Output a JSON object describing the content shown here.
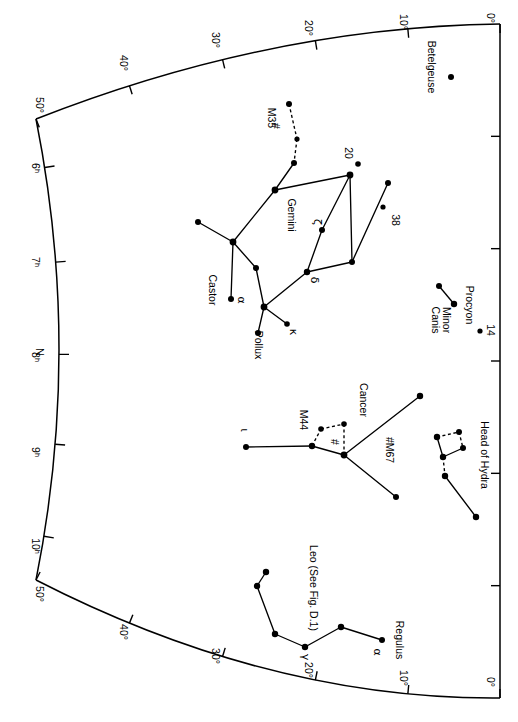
{
  "figure": {
    "kind": "star-chart",
    "orientation_note": "all text rotated 90 degrees clockwise"
  },
  "axes": {
    "declination_top_label": "Declination",
    "top_ticks": [
      {
        "label": "50°",
        "x": 36,
        "y": 105
      },
      {
        "label": "40°",
        "x": 120,
        "y": 63
      },
      {
        "label": "30°",
        "x": 212,
        "y": 40
      },
      {
        "label": "20°",
        "x": 305,
        "y": 28
      },
      {
        "label": "10°",
        "x": 400,
        "y": 22
      },
      {
        "label": "0°",
        "x": 487,
        "y": 18
      }
    ],
    "bottom_ticks": [
      {
        "label": "50°",
        "x": 36,
        "y": 594
      },
      {
        "label": "40°",
        "x": 120,
        "y": 632
      },
      {
        "label": "30°",
        "x": 212,
        "y": 656
      },
      {
        "label": "20°",
        "x": 305,
        "y": 670
      },
      {
        "label": "10°",
        "x": 400,
        "y": 678
      },
      {
        "label": "0°",
        "x": 487,
        "y": 682
      }
    ],
    "ra_ticks": [
      {
        "label": "6",
        "sup": "h",
        "y": 168
      },
      {
        "label": "7",
        "sup": "h",
        "y": 262
      },
      {
        "label": "8",
        "sup": "h",
        "y": 357
      },
      {
        "label": "9",
        "sup": "h",
        "y": 452
      },
      {
        "label": "10",
        "sup": "h",
        "y": 546
      }
    ],
    "north_marker": "N"
  },
  "chart_data": {
    "type": "scatter",
    "title": "",
    "xlabel": "Declination",
    "ylabel": "Right Ascension",
    "xlim": [
      0,
      50
    ],
    "ylim": [
      6,
      10
    ],
    "grid": false,
    "legend": "none",
    "constellations": [
      {
        "name": "Gemini",
        "label": {
          "text": "Gemini",
          "x": 288,
          "y": 215
        },
        "stars": [
          {
            "id": "g1",
            "x": 289,
            "y": 104,
            "label": "",
            "r": 3.0
          },
          {
            "id": "g2",
            "x": 297,
            "y": 139,
            "label": "",
            "r": 2.6
          },
          {
            "id": "g3",
            "x": 294,
            "y": 163,
            "label": "",
            "r": 3.0
          },
          {
            "id": "g4",
            "x": 275,
            "y": 190,
            "label": "",
            "r": 3.4
          },
          {
            "id": "g5",
            "x": 233,
            "y": 242,
            "label": "",
            "r": 3.4
          },
          {
            "id": "g6",
            "x": 198,
            "y": 222,
            "label": "",
            "r": 3.0
          },
          {
            "id": "g7",
            "x": 231,
            "y": 299,
            "label": "α",
            "lx": 238,
            "ly": 300,
            "r": 3.0
          },
          {
            "id": "g8",
            "x": 256,
            "y": 268,
            "label": "",
            "r": 3.0
          },
          {
            "id": "g9",
            "x": 264,
            "y": 307,
            "label": "",
            "r": 3.4
          },
          {
            "id": "g10",
            "x": 258,
            "y": 333,
            "label": "",
            "r": 3.0
          },
          {
            "id": "g11",
            "x": 287,
            "y": 324,
            "label": "κ",
            "lx": 290,
            "ly": 332,
            "r": 2.8
          },
          {
            "id": "g12",
            "x": 307,
            "y": 272,
            "label": "δ",
            "lx": 311,
            "ly": 280,
            "r": 3.2
          },
          {
            "id": "g13",
            "x": 322,
            "y": 230,
            "label": "ζ",
            "lx": 314,
            "ly": 222,
            "r": 3.0
          },
          {
            "id": "g14",
            "x": 350,
            "y": 175,
            "label": "",
            "r": 3.4
          },
          {
            "id": "g15",
            "x": 358,
            "y": 164,
            "label": "20",
            "lx": 345,
            "ly": 153,
            "r": 2.8
          },
          {
            "id": "g16",
            "x": 352,
            "y": 262,
            "label": "",
            "r": 3.0
          },
          {
            "id": "g17",
            "x": 388,
            "y": 183,
            "label": "",
            "r": 3.0
          },
          {
            "id": "g18",
            "x": 383,
            "y": 207,
            "label": "38",
            "lx": 392,
            "ly": 220,
            "r": 2.6
          }
        ],
        "labels_extra": [
          {
            "text": "Castor",
            "x": 209,
            "y": 290
          },
          {
            "text": "Pollux",
            "x": 255,
            "y": 345
          },
          {
            "text": "M35",
            "x": 268,
            "y": 118
          },
          {
            "text": "#",
            "x": 272,
            "y": 126
          }
        ],
        "lines": [
          [
            "g1",
            "g2"
          ],
          [
            "g2",
            "g3"
          ],
          [
            "g3",
            "g4"
          ],
          [
            "g4",
            "g5"
          ],
          [
            "g5",
            "g6"
          ],
          [
            "g5",
            "g7"
          ],
          [
            "g5",
            "g8"
          ],
          [
            "g8",
            "g9"
          ],
          [
            "g9",
            "g10"
          ],
          [
            "g9",
            "g11"
          ],
          [
            "g9",
            "g12"
          ],
          [
            "g12",
            "g13"
          ],
          [
            "g13",
            "g14"
          ],
          [
            "g4",
            "g14"
          ],
          [
            "g14",
            "g16"
          ],
          [
            "g12",
            "g16"
          ],
          [
            "g16",
            "g17"
          ]
        ],
        "dashed_lines": [
          [
            "g1",
            "g2"
          ],
          [
            "g2",
            "g3"
          ]
        ]
      },
      {
        "name": "Cancer",
        "label": {
          "text": "Cancer",
          "x": 360,
          "y": 400
        },
        "stars": [
          {
            "id": "c1",
            "x": 246,
            "y": 447,
            "label": "ι",
            "lx": 241,
            "ly": 430,
            "r": 3.0
          },
          {
            "id": "c2",
            "x": 312,
            "y": 446,
            "label": "M44",
            "lx": 300,
            "ly": 420,
            "r": 3.2
          },
          {
            "id": "c3",
            "x": 321,
            "y": 429,
            "label": "",
            "r": 2.8
          },
          {
            "id": "c4",
            "x": 344,
            "y": 424,
            "label": "",
            "r": 2.8
          },
          {
            "id": "c5",
            "x": 344,
            "y": 455,
            "label": "",
            "r": 3.4
          },
          {
            "id": "c6",
            "x": 420,
            "y": 396,
            "label": "",
            "r": 3.2
          },
          {
            "id": "c7",
            "x": 396,
            "y": 497,
            "label": "#M67",
            "lx": 386,
            "ly": 450,
            "r": 3.0
          }
        ],
        "labels_extra": [
          {
            "text": "#",
            "x": 331,
            "y": 442
          }
        ],
        "lines": [
          [
            "c1",
            "c2"
          ],
          [
            "c2",
            "c5"
          ],
          [
            "c5",
            "c6"
          ],
          [
            "c5",
            "c7"
          ]
        ],
        "dashed_lines": [
          [
            "c2",
            "c3"
          ],
          [
            "c3",
            "c4"
          ],
          [
            "c4",
            "c5"
          ]
        ]
      },
      {
        "name": "Leo",
        "label": {
          "text": "Leo (See Fig. D.1)",
          "x": 310,
          "y": 588
        },
        "stars": [
          {
            "id": "l1",
            "x": 266,
            "y": 572,
            "label": "",
            "r": 3.2
          },
          {
            "id": "l2",
            "x": 257,
            "y": 586,
            "label": "",
            "r": 3.2
          },
          {
            "id": "l3",
            "x": 275,
            "y": 634,
            "label": "",
            "r": 3.2
          },
          {
            "id": "l4",
            "x": 305,
            "y": 647,
            "label": "γ",
            "lx": 302,
            "ly": 657,
            "r": 3.2
          },
          {
            "id": "l5",
            "x": 341,
            "y": 627,
            "label": "",
            "r": 3.2
          },
          {
            "id": "l6",
            "x": 382,
            "y": 640,
            "label": "α",
            "lx": 374,
            "ly": 652,
            "r": 3.0
          }
        ],
        "labels_extra": [
          {
            "text": "Regulus",
            "x": 396,
            "y": 640
          }
        ],
        "lines": [
          [
            "l1",
            "l2"
          ],
          [
            "l2",
            "l3"
          ],
          [
            "l3",
            "l4"
          ],
          [
            "l4",
            "l5"
          ],
          [
            "l5",
            "l6"
          ]
        ],
        "dashed_lines": []
      },
      {
        "name": "Canis Minor",
        "label": {
          "text": "Canis\nMinor",
          "x": 432,
          "y": 320
        },
        "stars": [
          {
            "id": "m1",
            "x": 439,
            "y": 286,
            "label": "",
            "r": 3.0
          },
          {
            "id": "m2",
            "x": 454,
            "y": 304,
            "label": "",
            "r": 3.2
          },
          {
            "id": "m3",
            "x": 480,
            "y": 331,
            "label": "14",
            "lx": 487,
            "ly": 330,
            "r": 2.6
          }
        ],
        "labels_extra": [
          {
            "text": "Procyon",
            "x": 466,
            "y": 305
          }
        ],
        "lines": [
          [
            "m1",
            "m2"
          ]
        ],
        "dashed_lines": []
      },
      {
        "name": "Head of Hydra",
        "label": {
          "text": "Head of Hydra",
          "x": 481,
          "y": 455
        },
        "stars": [
          {
            "id": "h1",
            "x": 437,
            "y": 437,
            "label": "",
            "r": 3.2
          },
          {
            "id": "h2",
            "x": 459,
            "y": 432,
            "label": "",
            "r": 3.0
          },
          {
            "id": "h3",
            "x": 463,
            "y": 448,
            "label": "",
            "r": 3.0
          },
          {
            "id": "h4",
            "x": 443,
            "y": 457,
            "label": "",
            "r": 3.2
          },
          {
            "id": "h5",
            "x": 445,
            "y": 476,
            "label": "",
            "r": 3.2
          },
          {
            "id": "h6",
            "x": 476,
            "y": 517,
            "label": "",
            "r": 3.2
          }
        ],
        "labels_extra": [],
        "lines": [
          [
            "h1",
            "h4"
          ],
          [
            "h3",
            "h4"
          ],
          [
            "h5",
            "h6"
          ]
        ],
        "dashed_lines": [
          [
            "h1",
            "h2"
          ],
          [
            "h2",
            "h3"
          ],
          [
            "h4",
            "h5"
          ]
        ]
      },
      {
        "name": "Orion",
        "label": {
          "text": "",
          "x": 0,
          "y": 0
        },
        "stars": [
          {
            "id": "o1",
            "x": 451,
            "y": 77,
            "label": "",
            "r": 3.0
          }
        ],
        "labels_extra": [
          {
            "text": "Betelgeuse",
            "x": 428,
            "y": 67
          }
        ],
        "lines": [],
        "dashed_lines": []
      }
    ]
  }
}
